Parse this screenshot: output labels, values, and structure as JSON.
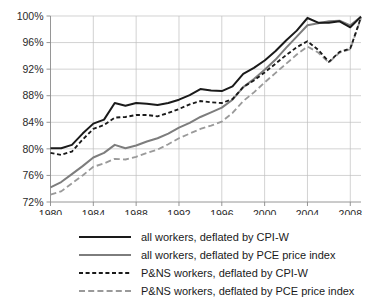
{
  "chart_data": {
    "type": "line",
    "title": "",
    "subtitle": "",
    "xlabel": "",
    "ylabel": "",
    "xlim": [
      1980,
      2009
    ],
    "ylim": [
      72,
      100
    ],
    "y_tick_format": "percent",
    "grid": true,
    "legend_position": "bottom",
    "x_ticks": [
      1980,
      1984,
      1988,
      1992,
      1996,
      2000,
      2004,
      2008
    ],
    "x_tick_labels": [
      "1980",
      "1984",
      "1988",
      "1992",
      "1996",
      "2000",
      "2004",
      "2008"
    ],
    "y_ticks": [
      72,
      76,
      80,
      84,
      88,
      92,
      96,
      100
    ],
    "y_tick_labels": [
      "72%",
      "76%",
      "80%",
      "84%",
      "88%",
      "92%",
      "96%",
      "100%"
    ],
    "x": [
      1980,
      1981,
      1982,
      1983,
      1984,
      1985,
      1986,
      1987,
      1988,
      1989,
      1990,
      1991,
      1992,
      1993,
      1994,
      1995,
      1996,
      1997,
      1998,
      1999,
      2000,
      2001,
      2002,
      2003,
      2004,
      2005,
      2006,
      2007,
      2008,
      2009
    ],
    "series": [
      {
        "name": "all workers, deflated by CPI-W",
        "color": "#1a1a1a",
        "style": "solid",
        "values": [
          80.1,
          80.1,
          80.6,
          82.3,
          83.8,
          84.4,
          86.9,
          86.5,
          86.9,
          86.8,
          86.6,
          86.9,
          87.4,
          88.1,
          89.0,
          88.8,
          88.7,
          89.4,
          91.3,
          92.2,
          93.3,
          94.7,
          96.3,
          97.8,
          99.7,
          99.0,
          99.0,
          99.2,
          98.3,
          99.9
        ]
      },
      {
        "name": "all workers, deflated by PCE price index",
        "color": "#7d7d7d",
        "style": "solid",
        "values": [
          74.2,
          75.0,
          76.2,
          77.4,
          78.7,
          79.4,
          80.6,
          80.1,
          80.5,
          81.1,
          81.6,
          82.3,
          83.2,
          83.9,
          84.8,
          85.5,
          86.2,
          87.4,
          89.3,
          90.5,
          91.9,
          93.4,
          95.2,
          96.9,
          98.6,
          98.9,
          99.2,
          99.3,
          98.6,
          99.9
        ]
      },
      {
        "name": "P&NS workers, deflated by CPI-W",
        "color": "#1a1a1a",
        "style": "dashed",
        "values": [
          79.4,
          79.1,
          79.6,
          81.4,
          83.0,
          83.6,
          84.7,
          84.8,
          85.1,
          85.1,
          84.9,
          85.4,
          86.0,
          86.7,
          87.2,
          87.0,
          86.9,
          87.5,
          89.3,
          90.3,
          91.5,
          92.8,
          94.1,
          95.3,
          96.2,
          94.9,
          93.1,
          94.6,
          95.1,
          99.8
        ]
      },
      {
        "name": "P&NS workers, deflated by PCE price index",
        "color": "#9a9a9a",
        "style": "dashed",
        "values": [
          73.1,
          73.6,
          74.8,
          76.0,
          77.3,
          77.8,
          78.5,
          78.4,
          78.8,
          79.4,
          79.9,
          80.7,
          81.6,
          82.3,
          83.0,
          83.5,
          84.1,
          85.4,
          87.2,
          88.5,
          90.0,
          91.4,
          92.8,
          94.2,
          95.4,
          94.5,
          93.0,
          94.5,
          95.0,
          99.7
        ]
      }
    ]
  },
  "legend": {
    "items": [
      {
        "label": "all workers, deflated by CPI-W"
      },
      {
        "label": "all workers, deflated by PCE price index"
      },
      {
        "label": "P&NS workers, deflated by CPI-W"
      },
      {
        "label": "P&NS workers, deflated by PCE price index"
      }
    ]
  }
}
